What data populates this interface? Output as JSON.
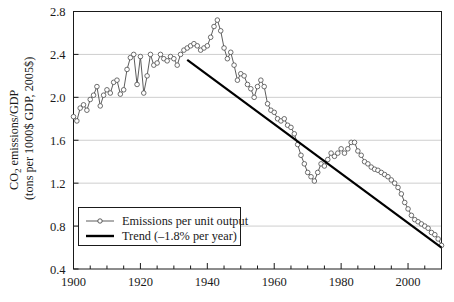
{
  "chart_data": {
    "type": "line",
    "title": "",
    "xlabel": "",
    "ylabel_line1": "CO",
    "ylabel_sub": "2",
    "ylabel_line1b": " emissions/GDP",
    "ylabel_line2": "(tons per 1000$ GDP, 2005$)",
    "ylabel_full": "CO2 emissions/GDP (tons per 1000$ GDP, 2005$)",
    "xlim": [
      1900,
      2010
    ],
    "ylim": [
      0.4,
      2.8
    ],
    "xticks": [
      1900,
      1920,
      1940,
      1960,
      1980,
      2000
    ],
    "xtick_labels": [
      "1900",
      "1920",
      "1940",
      "1960",
      "1980",
      "2000"
    ],
    "xminor_step": 5,
    "yticks": [
      0.4,
      0.8,
      1.2,
      1.6,
      2.0,
      2.4,
      2.8
    ],
    "ytick_labels": [
      "0.4",
      "0.8",
      "1.2",
      "1.6",
      "2.0",
      "2.4",
      "2.8"
    ],
    "grid": "horizontal",
    "grid_color": "#b9b9b9",
    "axis_color": "#1a1a1a",
    "legend_position": "lower-left",
    "series": [
      {
        "name": "Emissions per unit output",
        "key": "emissions",
        "color": "#4a4a4a",
        "marker": "open-circle",
        "marker_size": 2.3,
        "line_width": 0.9,
        "x": [
          1900,
          1901,
          1902,
          1903,
          1904,
          1905,
          1906,
          1907,
          1908,
          1909,
          1910,
          1911,
          1912,
          1913,
          1914,
          1915,
          1916,
          1917,
          1918,
          1919,
          1920,
          1921,
          1922,
          1923,
          1924,
          1925,
          1926,
          1927,
          1928,
          1929,
          1930,
          1931,
          1932,
          1933,
          1934,
          1935,
          1936,
          1937,
          1938,
          1939,
          1940,
          1941,
          1942,
          1943,
          1944,
          1945,
          1946,
          1947,
          1948,
          1949,
          1950,
          1951,
          1952,
          1953,
          1954,
          1955,
          1956,
          1957,
          1958,
          1959,
          1960,
          1961,
          1962,
          1963,
          1964,
          1965,
          1966,
          1967,
          1968,
          1969,
          1970,
          1971,
          1972,
          1973,
          1974,
          1975,
          1976,
          1977,
          1978,
          1979,
          1980,
          1981,
          1982,
          1983,
          1984,
          1985,
          1986,
          1987,
          1988,
          1989,
          1990,
          1991,
          1992,
          1993,
          1994,
          1995,
          1996,
          1997,
          1998,
          1999,
          2000,
          2001,
          2002,
          2003,
          2004,
          2005,
          2006,
          2007,
          2008,
          2009,
          2010
        ],
        "y": [
          1.82,
          1.78,
          1.9,
          1.93,
          1.88,
          1.98,
          2.02,
          2.1,
          1.92,
          2.02,
          2.07,
          2.04,
          2.14,
          2.16,
          2.03,
          2.07,
          2.26,
          2.37,
          2.4,
          2.12,
          2.38,
          2.04,
          2.2,
          2.4,
          2.3,
          2.32,
          2.4,
          2.36,
          2.34,
          2.38,
          2.36,
          2.3,
          2.4,
          2.44,
          2.46,
          2.48,
          2.5,
          2.48,
          2.44,
          2.46,
          2.48,
          2.56,
          2.66,
          2.72,
          2.62,
          2.46,
          2.36,
          2.42,
          2.3,
          2.16,
          2.22,
          2.2,
          2.12,
          2.08,
          2.0,
          2.1,
          2.16,
          2.1,
          1.94,
          1.88,
          1.86,
          1.8,
          1.78,
          1.8,
          1.74,
          1.72,
          1.66,
          1.56,
          1.46,
          1.38,
          1.3,
          1.26,
          1.22,
          1.3,
          1.38,
          1.36,
          1.42,
          1.48,
          1.45,
          1.48,
          1.52,
          1.48,
          1.52,
          1.58,
          1.58,
          1.5,
          1.46,
          1.4,
          1.38,
          1.35,
          1.33,
          1.32,
          1.3,
          1.28,
          1.26,
          1.23,
          1.2,
          1.16,
          1.1,
          1.02,
          0.96,
          0.9,
          0.86,
          0.84,
          0.82,
          0.8,
          0.78,
          0.74,
          0.72,
          0.68,
          0.62
        ],
        "note_peak_year": 1943,
        "note_peak_value": 2.72,
        "note_end_value": 0.62
      },
      {
        "name": "Trend (–1.8% per year)",
        "key": "trend",
        "color": "#000000",
        "marker": "none",
        "line_width": 2.2,
        "x": [
          1934,
          2010
        ],
        "y": [
          2.35,
          0.6
        ],
        "slope_pct_per_year": -1.8
      }
    ],
    "legend": {
      "entries": [
        {
          "label": "Emissions per unit output",
          "style": "line-marker",
          "color": "#4a4a4a"
        },
        {
          "label": "Trend (–1.8% per year)",
          "style": "thick-line",
          "color": "#000000"
        }
      ]
    }
  }
}
